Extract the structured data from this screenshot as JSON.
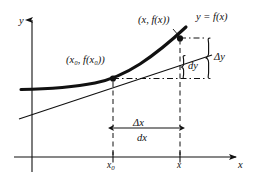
{
  "figure": {
    "background_color": "#ffffff",
    "ink_color": "#111111"
  },
  "axes": {
    "y_axis_label": "y",
    "x_axis_label": "x",
    "x_ticks": [
      {
        "label_base": "x",
        "label_sub": "0",
        "name": "x0"
      },
      {
        "label_base": "x",
        "label_sub": "",
        "name": "x"
      }
    ]
  },
  "curve": {
    "label": "y = f(x)",
    "name": "function-curve"
  },
  "tangent": {
    "name": "tangent-line"
  },
  "points": [
    {
      "name": "point-x0",
      "label": "(x₀, f(x₀))",
      "label_parts": {
        "open": "(",
        "x": "x",
        "xsub": "0",
        "comma": ", ",
        "f": "f(",
        "fx": "x",
        "fxsub": "0",
        "close": "))"
      }
    },
    {
      "name": "point-x",
      "label": "(x, f(x))",
      "label_parts": {
        "open": "(",
        "x": "x",
        "comma": ", ",
        "f": "f(",
        "fx": "x",
        "close": "))"
      }
    }
  ],
  "annotations": {
    "delta_y": "Δy",
    "dy": "dy",
    "delta_x": "Δx",
    "dx": "dx"
  }
}
